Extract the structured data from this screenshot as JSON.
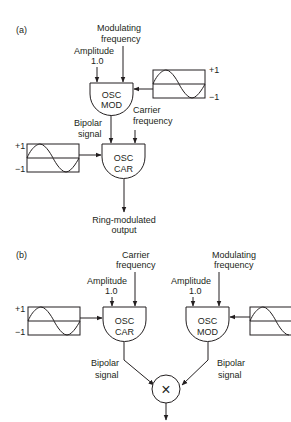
{
  "panel_a": {
    "label": "(a)",
    "modulating_frequency": [
      "Modulating",
      "frequency"
    ],
    "amplitude": [
      "Amplitude",
      "1.0"
    ],
    "osc_mod": [
      "OSC",
      "MOD"
    ],
    "wave_plus": "+1",
    "wave_minus": "−1",
    "bipolar_signal": [
      "Bipolar",
      "signal"
    ],
    "carrier_frequency": [
      "Carrier",
      "frequency"
    ],
    "wave2_plus": "+1",
    "wave2_minus": "−1",
    "osc_car": [
      "OSC",
      "CAR"
    ],
    "output": [
      "Ring-modulated",
      "output"
    ]
  },
  "panel_b": {
    "label": "(b)",
    "carrier_frequency": [
      "Carrier",
      "frequency"
    ],
    "modulating_frequency": [
      "Modulating",
      "frequency"
    ],
    "amplitude_car": [
      "Amplitude",
      "1.0"
    ],
    "amplitude_mod": [
      "Amplitude",
      "1.0"
    ],
    "wave_plus": "+1",
    "wave_minus": "−1",
    "osc_car": [
      "OSC",
      "CAR"
    ],
    "osc_mod": [
      "OSC",
      "MOD"
    ],
    "bipolar_left": [
      "Bipolar",
      "signal"
    ],
    "bipolar_right": [
      "Bipolar",
      "signal"
    ],
    "multiply_symbol": "×"
  }
}
